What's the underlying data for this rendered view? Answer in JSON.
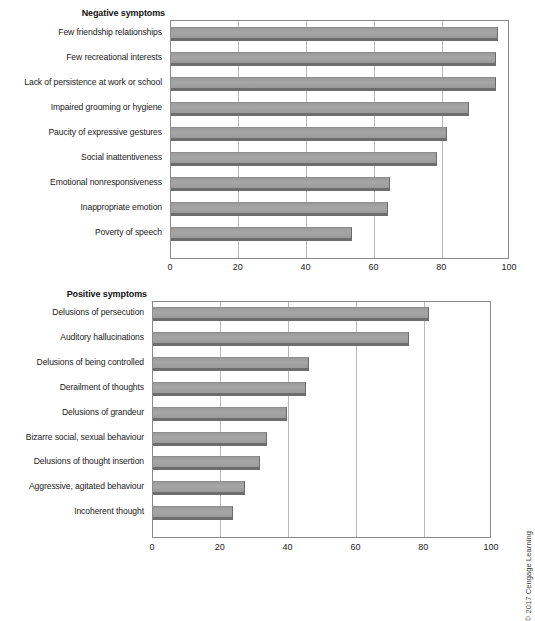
{
  "copyright": "© 2017 Cengage Learning",
  "axis": {
    "ticks": [
      "0",
      "20",
      "40",
      "60",
      "80",
      "100"
    ]
  },
  "panels": [
    {
      "id": "negative",
      "title": "Negative symptoms"
    },
    {
      "id": "positive",
      "title": "Positive symptoms"
    }
  ],
  "chart_data": [
    {
      "type": "bar",
      "orientation": "horizontal",
      "title": "Negative symptoms",
      "xlabel": "",
      "ylabel": "",
      "xlim": [
        0,
        100
      ],
      "xticks": [
        0,
        20,
        40,
        60,
        80,
        100
      ],
      "grid": true,
      "legend": false,
      "categories": [
        "Few friendship relationships",
        "Few recreational interests",
        "Lack of persistence at work or school",
        "Impaired grooming or hygiene",
        "Paucity of expressive gestures",
        "Social inattentiveness",
        "Emotional nonresponsiveness",
        "Inappropriate emotion",
        "Poverty of speech"
      ],
      "values": [
        96.5,
        96,
        96,
        88,
        81.5,
        78.5,
        64.5,
        64,
        53.5
      ]
    },
    {
      "type": "bar",
      "orientation": "horizontal",
      "title": "Positive symptoms",
      "xlabel": "",
      "ylabel": "",
      "xlim": [
        0,
        100
      ],
      "xticks": [
        0,
        20,
        40,
        60,
        80,
        100
      ],
      "grid": true,
      "legend": false,
      "categories": [
        "Delusions of persecution",
        "Auditory hallucinations",
        "Delusions of being controlled",
        "Derailment of thoughts",
        "Delusions of grandeur",
        "Bizarre social, sexual behaviour",
        "Delusions of thought insertion",
        "Aggressive, agitated behaviour",
        "Incoherent thought"
      ],
      "values": [
        81.5,
        75.5,
        46,
        45,
        39.5,
        33.5,
        31.5,
        27,
        23.5
      ]
    }
  ]
}
